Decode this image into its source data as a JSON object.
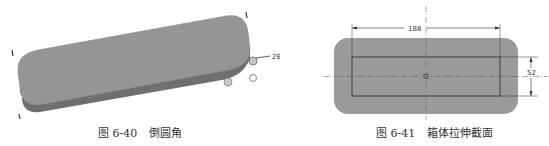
{
  "figures": [
    {
      "id": "fig-6-40",
      "number": "图 6-40",
      "title": "倒圆角",
      "callout_value": "26",
      "colors": {
        "top_face": "#959595",
        "side_face": "#6f6f6f",
        "handle": "#c8c8c8"
      }
    },
    {
      "id": "fig-6-41",
      "number": "图 6-41",
      "title": "箱体拉伸截面",
      "dimensions": {
        "width": "188",
        "height": "52"
      },
      "colors": {
        "fill": "#9a9a9a",
        "outline": "#3a3a3a",
        "dim_line": "#333333"
      }
    }
  ]
}
